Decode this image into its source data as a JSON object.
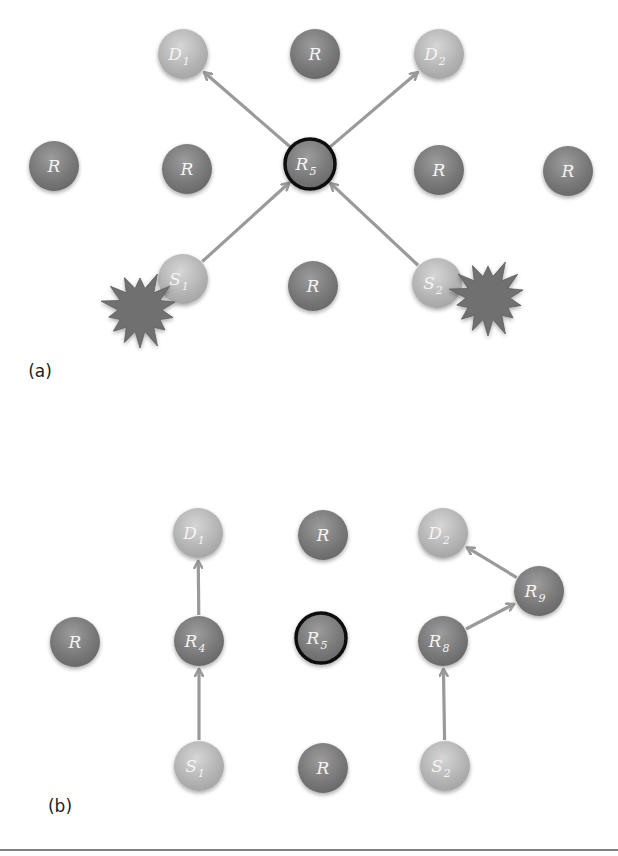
{
  "figure": {
    "panels": [
      {
        "id": "a",
        "label": "(a)",
        "label_pos": [
          40,
          377
        ],
        "nodes": [
          {
            "id": "D1",
            "text": "D",
            "sub": "1",
            "type": "destination",
            "x": 183,
            "y": 54
          },
          {
            "id": "Rt",
            "text": "R",
            "sub": "",
            "type": "relay",
            "x": 315,
            "y": 54
          },
          {
            "id": "D2",
            "text": "D",
            "sub": "2",
            "type": "destination",
            "x": 439,
            "y": 54
          },
          {
            "id": "Rl1",
            "text": "R",
            "sub": "",
            "type": "relay",
            "x": 54,
            "y": 166
          },
          {
            "id": "Rl2",
            "text": "R",
            "sub": "",
            "type": "relay",
            "x": 187,
            "y": 169
          },
          {
            "id": "R5",
            "text": "R",
            "sub": "5",
            "type": "bottleneck",
            "x": 310,
            "y": 164
          },
          {
            "id": "Rr1",
            "text": "R",
            "sub": "",
            "type": "relay",
            "x": 439,
            "y": 170
          },
          {
            "id": "Rr2",
            "text": "R",
            "sub": "",
            "type": "relay",
            "x": 568,
            "y": 171
          },
          {
            "id": "S1",
            "text": "S",
            "sub": "1",
            "type": "source",
            "x": 183,
            "y": 279
          },
          {
            "id": "Rb",
            "text": "R",
            "sub": "",
            "type": "relay",
            "x": 313,
            "y": 286
          },
          {
            "id": "S2",
            "text": "S",
            "sub": "2",
            "type": "source",
            "x": 437,
            "y": 283
          }
        ],
        "edges": [
          {
            "from": "S1",
            "to": "R5"
          },
          {
            "from": "S2",
            "to": "R5"
          },
          {
            "from": "R5",
            "to": "D1"
          },
          {
            "from": "R5",
            "to": "D2"
          }
        ],
        "bursts": [
          {
            "x": 140,
            "y": 310,
            "r": 40
          },
          {
            "x": 488,
            "y": 298,
            "r": 40
          }
        ]
      },
      {
        "id": "b",
        "label": "(b)",
        "label_pos": [
          60,
          812
        ],
        "nodes": [
          {
            "id": "D1",
            "text": "D",
            "sub": "1",
            "type": "destination",
            "x": 198,
            "y": 533
          },
          {
            "id": "Rt",
            "text": "R",
            "sub": "",
            "type": "relay",
            "x": 323,
            "y": 535
          },
          {
            "id": "D2",
            "text": "D",
            "sub": "2",
            "type": "destination",
            "x": 443,
            "y": 533
          },
          {
            "id": "Rl",
            "text": "R",
            "sub": "",
            "type": "relay",
            "x": 75,
            "y": 642
          },
          {
            "id": "R4",
            "text": "R",
            "sub": "4",
            "type": "relay",
            "x": 199,
            "y": 641
          },
          {
            "id": "R5",
            "text": "R",
            "sub": "5",
            "type": "bottleneck",
            "x": 321,
            "y": 638
          },
          {
            "id": "R8",
            "text": "R",
            "sub": "8",
            "type": "relay",
            "x": 443,
            "y": 641
          },
          {
            "id": "R9",
            "text": "R",
            "sub": "9",
            "type": "relay",
            "x": 539,
            "y": 591
          },
          {
            "id": "S1",
            "text": "S",
            "sub": "1",
            "type": "source",
            "x": 199,
            "y": 766
          },
          {
            "id": "Rb",
            "text": "R",
            "sub": "",
            "type": "relay",
            "x": 323,
            "y": 768
          },
          {
            "id": "S2",
            "text": "S",
            "sub": "2",
            "type": "source",
            "x": 445,
            "y": 766
          }
        ],
        "edges": [
          {
            "from": "S1",
            "to": "R4"
          },
          {
            "from": "R4",
            "to": "D1"
          },
          {
            "from": "S2",
            "to": "R8"
          },
          {
            "from": "R8",
            "to": "R9"
          },
          {
            "from": "R9",
            "to": "D2"
          }
        ],
        "bursts": []
      }
    ],
    "bottom_rule_y": 850,
    "colors": {
      "relay": "#7a7a7a",
      "relay_light": "#9a9a9a",
      "endpoint": "#b4b4b4",
      "endpoint_light": "#d0d0d0",
      "bottleneck_ring": "#111111",
      "arrow": "#9a9a9a",
      "burst": "#6f6f6f",
      "rule": "#555555"
    },
    "node_radius": 25
  }
}
